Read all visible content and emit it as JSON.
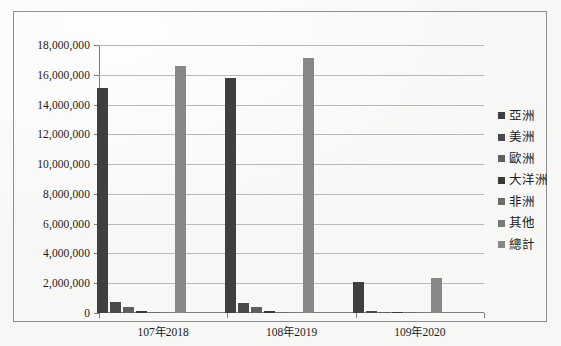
{
  "chart_data": {
    "type": "bar",
    "title": "",
    "xlabel": "",
    "ylabel": "",
    "categories": [
      "107年2018",
      "108年2019",
      "109年2020"
    ],
    "ylim": [
      0,
      18000000
    ],
    "ytick_step": 2000000,
    "ytick_labels": [
      "18,000,000",
      "16,000,000",
      "14,000,000",
      "12,000,000",
      "10,000,000",
      "8,000,000",
      "6,000,000",
      "4,000,000",
      "2,000,000",
      "0"
    ],
    "ytick_values": [
      18000000,
      16000000,
      14000000,
      12000000,
      10000000,
      8000000,
      6000000,
      4000000,
      2000000,
      0
    ],
    "grid": true,
    "legend_position": "right",
    "series": [
      {
        "name": "亞洲",
        "color": "#3f3f3f",
        "values": [
          15100000,
          15780000,
          2080000
        ]
      },
      {
        "name": "美洲",
        "color": "#4a4a4a",
        "values": [
          760000,
          700000,
          105000
        ]
      },
      {
        "name": "歐洲",
        "color": "#5e5e5e",
        "values": [
          410000,
          405000,
          62000
        ]
      },
      {
        "name": "大洋洲",
        "color": "#383838",
        "values": [
          120000,
          115000,
          16000
        ]
      },
      {
        "name": "非洲",
        "color": "#6b6b6b",
        "values": [
          28000,
          27000,
          4000
        ]
      },
      {
        "name": "其他",
        "color": "#7a7a7a",
        "values": [
          14000,
          13000,
          2000
        ]
      },
      {
        "name": "總計",
        "color": "#878787",
        "values": [
          16600000,
          17120000,
          2380000
        ]
      }
    ]
  },
  "legend": {
    "items": [
      {
        "label": "亞洲"
      },
      {
        "label": "美洲"
      },
      {
        "label": "歐洲"
      },
      {
        "label": "大洋洲"
      },
      {
        "label": "非洲"
      },
      {
        "label": "其他"
      },
      {
        "label": "總計"
      }
    ]
  }
}
